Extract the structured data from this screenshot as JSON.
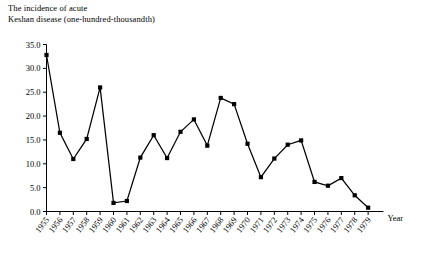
{
  "chart_data": {
    "type": "line",
    "title": "The incidence of acute\nKeshan disease (one-hundred-thousandth)",
    "xlabel": "Year",
    "ylabel": "",
    "ylim": [
      0.0,
      35.0
    ],
    "yticks": [
      "0.0",
      "5.0",
      "10.0",
      "15.0",
      "20.0",
      "25.0",
      "30.0",
      "35.0"
    ],
    "grid": false,
    "legend": "none",
    "marker": "filled-square",
    "categories": [
      "1955",
      "1956",
      "1957",
      "1958",
      "1959",
      "1960",
      "1961",
      "1962",
      "1963",
      "1964",
      "1965",
      "1966",
      "1967",
      "1968",
      "1969",
      "1970",
      "1971",
      "1972",
      "1973",
      "1974",
      "1975",
      "1976",
      "1977",
      "1978",
      "1979"
    ],
    "values": [
      32.8,
      16.5,
      11.0,
      15.2,
      26.0,
      1.8,
      2.2,
      11.3,
      16.0,
      11.2,
      16.7,
      19.3,
      13.8,
      23.8,
      22.5,
      14.2,
      7.2,
      11.1,
      14.0,
      14.9,
      6.2,
      5.4,
      7.0,
      3.4,
      0.8
    ]
  },
  "colors": {
    "line": "#000000",
    "axis": "#000000",
    "background": "#ffffff"
  }
}
